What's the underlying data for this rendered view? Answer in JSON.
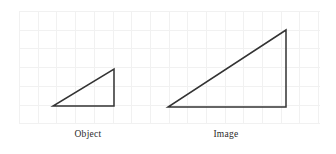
{
  "figure": {
    "background_color": "#ffffff",
    "width": 336,
    "height": 154,
    "grid": {
      "visible": true,
      "line_color": "#f1f1f1",
      "x_start": 19,
      "x_end": 320,
      "y_start": 11,
      "y_end": 124,
      "cell_size": 18.7,
      "columns": 16,
      "rows": 6
    },
    "stroke_color": "#333333",
    "stroke_width": 1.5,
    "shapes": [
      {
        "name": "object-triangle",
        "label": "Object",
        "kind": "right-triangle",
        "points": [
          [
            53,
            106
          ],
          [
            114,
            106
          ],
          [
            114,
            69
          ]
        ],
        "base_length_px": 61,
        "height_length_px": 37
      },
      {
        "name": "image-triangle",
        "label": "Image",
        "kind": "right-triangle",
        "points": [
          [
            168,
            107
          ],
          [
            286,
            107
          ],
          [
            286,
            30
          ]
        ],
        "base_length_px": 118,
        "height_length_px": 77
      }
    ],
    "captions": [
      {
        "text": "Object",
        "x": 88,
        "y": 129
      },
      {
        "text": "Image",
        "x": 226,
        "y": 129
      }
    ]
  }
}
